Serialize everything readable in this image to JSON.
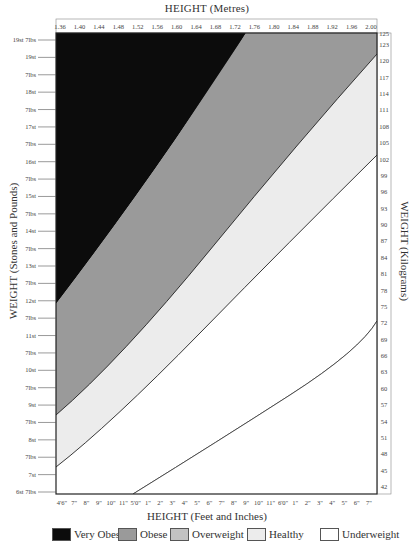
{
  "chart_data": {
    "type": "area",
    "title": "",
    "top_axis": {
      "label": "HEIGHT (Metres)",
      "ticks": [
        "1.36",
        "1.40",
        "1.44",
        "1.48",
        "1.52",
        "1.56",
        "1.60",
        "1.64",
        "1.68",
        "1.72",
        "1.76",
        "1.80",
        "1.84",
        "1.88",
        "1.92",
        "1.96",
        "2.00"
      ]
    },
    "bottom_axis": {
      "label": "HEIGHT (Feet and Inches)",
      "ticks": [
        "4'6\"",
        "7\"",
        "8\"",
        "9\"",
        "10\"",
        "11\"",
        "5'0\"",
        "1\"",
        "2\"",
        "3\"",
        "4\"",
        "5\"",
        "6\"",
        "7\"",
        "8\"",
        "9\"",
        "10\"",
        "11\"",
        "6'0\"",
        "1\"",
        "2\"",
        "3\"",
        "4\"",
        "5\"",
        "6\"",
        "7\""
      ]
    },
    "left_axis": {
      "label": "WEIGHT (Stones and Pounds)",
      "ticks": [
        "19st 7lbs",
        "19st",
        "7lbs",
        "18st",
        "7lbs",
        "17st",
        "7lbs",
        "16st",
        "7lbs",
        "15st",
        "7lbs",
        "14st",
        "7lbs",
        "13st",
        "7lbs",
        "12st",
        "7lbs",
        "11st",
        "7lbs",
        "10st",
        "7lbs",
        "9st",
        "7lbs",
        "8st",
        "7lbs",
        "7st",
        "6st 7lbs"
      ]
    },
    "right_axis": {
      "label": "WEIGHT (Kilograms)",
      "ticks": [
        "125",
        "123",
        "120",
        "117",
        "114",
        "111",
        "108",
        "105",
        "102",
        "99",
        "96",
        "93",
        "90",
        "87",
        "84",
        "81",
        "78",
        "75",
        "72",
        "69",
        "66",
        "63",
        "60",
        "57",
        "54",
        "51",
        "48",
        "45",
        "42"
      ]
    },
    "xlim_m": [
      1.36,
      2.0
    ],
    "ylim_kg": [
      42,
      125
    ],
    "bands": [
      {
        "name": "Very Obese",
        "color": "#0c0c0c"
      },
      {
        "name": "Obese",
        "color": "#9a9a9a"
      },
      {
        "name": "Overweight",
        "color": "#c2c2c2"
      },
      {
        "name": "Healthy",
        "color": "#ececec"
      },
      {
        "name": "Underweight",
        "color": "#ffffff"
      }
    ],
    "boundaries": [
      {
        "between": "Very Obese / Obese",
        "points_m_kg": [
          [
            1.36,
            74.5
          ],
          [
            1.56,
            87
          ],
          [
            1.75,
            125
          ]
        ]
      },
      {
        "between": "Obese / Overweight",
        "points_m_kg": [
          [
            1.36,
            52.5
          ],
          [
            1.68,
            84
          ],
          [
            2.0,
            121
          ]
        ]
      },
      {
        "between": "Overweight / Healthy",
        "points_m_kg": [
          [
            1.36,
            44
          ],
          [
            1.68,
            70
          ],
          [
            2.0,
            100
          ]
        ]
      },
      {
        "between": "Healthy / Underweight",
        "points_m_kg": [
          [
            1.52,
            42
          ],
          [
            1.76,
            57
          ],
          [
            2.0,
            75
          ]
        ]
      }
    ],
    "legend_position": "bottom"
  },
  "legend": [
    {
      "label": "Very Obese",
      "color": "#0c0c0c"
    },
    {
      "label": "Obese",
      "color": "#9a9a9a"
    },
    {
      "label": "Overweight",
      "color": "#c2c2c2"
    },
    {
      "label": "Healthy",
      "color": "#ececec"
    },
    {
      "label": "Underweight",
      "color": "#ffffff"
    }
  ]
}
